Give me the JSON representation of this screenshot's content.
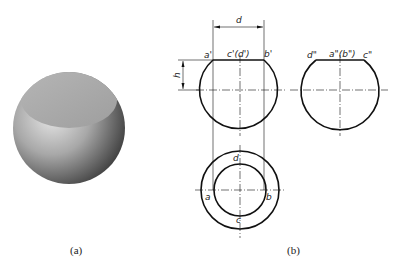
{
  "figure": {
    "captions": {
      "a": "(a)",
      "b": "(b)"
    },
    "solid_view": {
      "description": "shaded 3D truncated sphere (sphere with flat top cut)",
      "colors": {
        "top_face": "#a9a9a9",
        "body_light": "#d8d8d8",
        "body_dark": "#3a3a3a"
      }
    },
    "front_view": {
      "labels": {
        "dimension_width": "d",
        "dimension_height": "h",
        "left_point": "a'",
        "center_point": "c'(d')",
        "right_point": "b'"
      }
    },
    "side_view": {
      "labels": {
        "left_point": "d\"",
        "center_point": "a\"(b\")",
        "right_point": "c\""
      }
    },
    "top_view": {
      "labels": {
        "top_point": "d",
        "left_point": "a",
        "right_point": "b",
        "bottom_point": "c"
      }
    },
    "line_color": "#111111"
  }
}
